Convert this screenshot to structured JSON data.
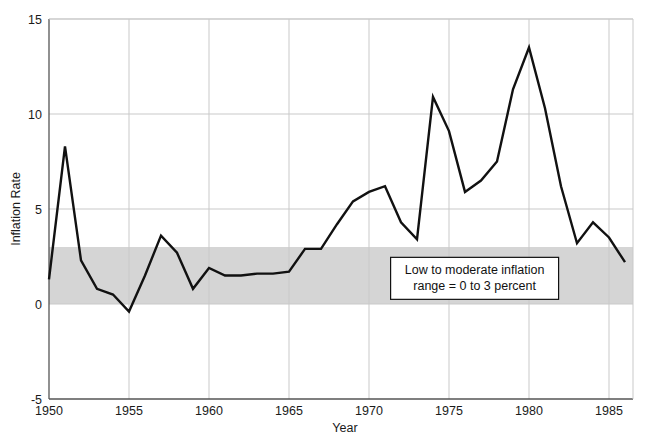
{
  "chart_data": {
    "type": "line",
    "title": "",
    "xlabel": "Year",
    "ylabel": "Inflation Rate",
    "xlim": [
      1950,
      1986.5
    ],
    "ylim": [
      -5,
      15
    ],
    "xticks": [
      1950,
      1955,
      1960,
      1965,
      1970,
      1975,
      1980,
      1985
    ],
    "xticklabels": [
      "1950",
      "1955",
      "1960",
      "1965",
      "1970",
      "1975",
      "1980",
      "1985"
    ],
    "yticks": [
      -5,
      0,
      5,
      10,
      15
    ],
    "yticklabels": [
      "-5",
      "0",
      "5",
      "10",
      "15"
    ],
    "grid": true,
    "legend": "none",
    "series": [
      {
        "name": "Inflation Rate",
        "color": "#111111",
        "x": [
          1950,
          1951,
          1952,
          1953,
          1954,
          1955,
          1956,
          1957,
          1958,
          1959,
          1960,
          1961,
          1962,
          1963,
          1964,
          1965,
          1966,
          1967,
          1968,
          1969,
          1970,
          1971,
          1972,
          1973,
          1974,
          1975,
          1976,
          1977,
          1978,
          1979,
          1980,
          1981,
          1982,
          1983,
          1984,
          1985,
          1986
        ],
        "values": [
          1.3,
          8.3,
          2.3,
          0.8,
          0.5,
          -0.4,
          1.5,
          3.6,
          2.7,
          0.8,
          1.9,
          1.5,
          1.5,
          1.6,
          1.6,
          1.7,
          2.9,
          2.9,
          4.2,
          5.4,
          5.9,
          6.2,
          4.3,
          3.4,
          10.9,
          9.1,
          5.9,
          6.5,
          7.5,
          11.3,
          13.5,
          10.3,
          6.2,
          3.2,
          4.3,
          3.5,
          2.2
        ]
      }
    ],
    "shaded_band": {
      "name": "low-to-moderate-inflation-band",
      "y_from": 0,
      "y_to": 3,
      "color": "#d5d5d5"
    },
    "annotations": [
      {
        "name": "inflation-band-callout",
        "line1": "Low to moderate inflation",
        "line2": "range = 0 to 3 percent",
        "x_center": 1976.6,
        "y_center": 1.35
      }
    ]
  },
  "axes": {
    "y_title": "Inflation Rate",
    "x_title": "Year"
  },
  "colors": {
    "line": "#111111",
    "band": "#d5d5d5",
    "grid": "#c9c9c9",
    "axis": "#555555",
    "background": "#ffffff"
  }
}
